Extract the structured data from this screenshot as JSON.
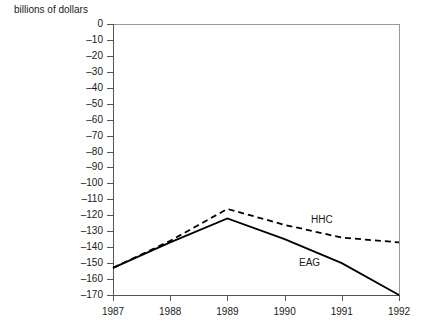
{
  "chart_data": {
    "type": "line",
    "title": "",
    "subtitle": "",
    "ylabel": "billions of dollars",
    "xlabel": "",
    "x": [
      1987,
      1988,
      1989,
      1990,
      1991,
      1992
    ],
    "xtick_labels": [
      "1987",
      "1988",
      "1989",
      "1990",
      "1991",
      "1992"
    ],
    "ytick_labels": [
      "0",
      "–10",
      "–20",
      "–30",
      "–40",
      "–50",
      "–60",
      "–70",
      "–80",
      "–90",
      "–100",
      "–110",
      "–120",
      "–130",
      "–140",
      "–150",
      "–160",
      "–170"
    ],
    "ytick_values": [
      0,
      -10,
      -20,
      -30,
      -40,
      -50,
      -60,
      -70,
      -80,
      -90,
      -100,
      -110,
      -120,
      -130,
      -140,
      -150,
      -160,
      -170
    ],
    "xlim": [
      1987,
      1992
    ],
    "ylim": [
      -170,
      0
    ],
    "grid": false,
    "legend_position": "inline",
    "series": [
      {
        "name": "HHC",
        "style": "dashed",
        "color": "#000000",
        "values": [
          -153,
          -136,
          -116,
          -126,
          -134,
          -137
        ],
        "label_text": "HHC"
      },
      {
        "name": "EAG",
        "style": "solid",
        "color": "#000000",
        "values": [
          -153,
          -137,
          -122,
          -135,
          -150,
          -170
        ],
        "label_text": "EAG"
      }
    ]
  },
  "axes": {
    "frame_color": "#999999",
    "axis_color": "#555555",
    "tick_color": "#555555"
  }
}
